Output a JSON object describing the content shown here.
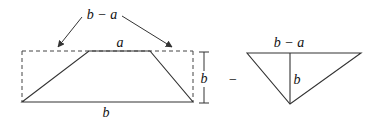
{
  "colors": {
    "stroke": "#333333",
    "text": "#111111",
    "background": "#ffffff"
  },
  "left_figure": {
    "top_arrow_label": "b − a",
    "top_side_label": "a",
    "bottom_side_label": "b",
    "height_label": "b"
  },
  "operator": "−",
  "right_figure": {
    "top_side_label": "b − a",
    "height_label": "b"
  }
}
